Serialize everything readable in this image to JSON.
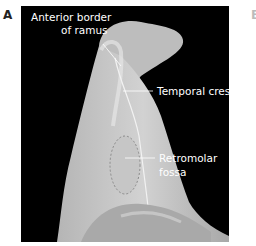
{
  "figure": {
    "panel_label": "A",
    "next_panel_label_partial": "B",
    "labels": {
      "anterior_border": [
        "Anterior border",
        "of ramus"
      ],
      "temporal_crest": "Temporal crest",
      "retromolar_fossa": [
        "Retromolar",
        "fossa"
      ]
    },
    "colors": {
      "background": "#000000",
      "bone": "#c8c8c8",
      "label_text": "#ffffff",
      "fossa_outline": "#8a8a8a"
    }
  }
}
